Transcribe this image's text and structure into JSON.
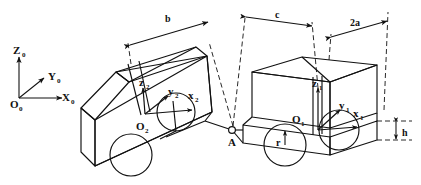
{
  "figure": {
    "background_color": "#ffffff",
    "line_color": "#111111"
  },
  "global_frame": {
    "origin_label": "O",
    "origin_sub": "0",
    "axes": [
      {
        "name": "x-axis-global",
        "label": "X",
        "sub": "0"
      },
      {
        "name": "y-axis-global",
        "label": "Y",
        "sub": "0"
      },
      {
        "name": "z-axis-global",
        "label": "Z",
        "sub": "0"
      }
    ]
  },
  "body_frames": [
    {
      "name": "trailer-frame",
      "origin_label": "O",
      "origin_sub": "2",
      "axes": [
        {
          "label": "x",
          "sub": "2"
        },
        {
          "label": "y",
          "sub": "2"
        },
        {
          "label": "z",
          "sub": "2"
        }
      ]
    },
    {
      "name": "tractor-frame",
      "origin_label": "O",
      "origin_sub": "1",
      "axes": [
        {
          "label": "x",
          "sub": "1"
        },
        {
          "label": "y",
          "sub": "1"
        },
        {
          "label": "z",
          "sub": "1"
        }
      ]
    }
  ],
  "hitch": {
    "label": "A"
  },
  "dimensions": [
    {
      "name": "dimension-b",
      "label": "b"
    },
    {
      "name": "dimension-c",
      "label": "c"
    },
    {
      "name": "dimension-2a",
      "label": "2a"
    },
    {
      "name": "dimension-h",
      "label": "h"
    },
    {
      "name": "dimension-r",
      "label": "r"
    }
  ]
}
